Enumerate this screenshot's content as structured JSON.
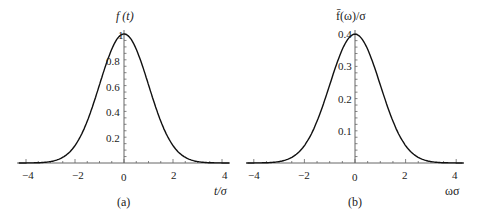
{
  "chart_data": [
    {
      "type": "line",
      "panel": "a",
      "caption": "(a)",
      "title": "",
      "xlabel": "t/σ",
      "ylabel": "f(t)",
      "xlim": [
        -4.2,
        4.2
      ],
      "ylim": [
        0,
        1.0
      ],
      "xticks": [
        -4,
        -2,
        0,
        2,
        4
      ],
      "xtick_labels": [
        "−4",
        "−2",
        "0",
        "2",
        "4"
      ],
      "yticks": [
        0.2,
        0.4,
        0.6,
        0.8,
        1
      ],
      "ytick_labels": [
        "0.2",
        "0.4",
        "0.6",
        "0.8",
        "1"
      ],
      "grid": false,
      "series": [
        {
          "name": "f(t)",
          "formula": "exp(-x^2/2)",
          "x": [
            -4,
            -3,
            -2.5,
            -2,
            -1.5,
            -1,
            -0.5,
            0,
            0.5,
            1,
            1.5,
            2,
            2.5,
            3,
            4
          ],
          "y": [
            0.0003,
            0.011,
            0.044,
            0.135,
            0.325,
            0.607,
            0.882,
            1.0,
            0.882,
            0.607,
            0.325,
            0.135,
            0.044,
            0.011,
            0.0003
          ]
        }
      ]
    },
    {
      "type": "line",
      "panel": "b",
      "caption": "(b)",
      "title": "",
      "xlabel": "ωσ",
      "ylabel": "f̄(ω)/σ",
      "xlim": [
        -4.2,
        4.2
      ],
      "ylim": [
        0,
        0.4
      ],
      "xticks": [
        -4,
        -2,
        0,
        2,
        4
      ],
      "xtick_labels": [
        "−4",
        "−2",
        "0",
        "2",
        "4"
      ],
      "yticks": [
        0.1,
        0.2,
        0.3,
        0.4
      ],
      "ytick_labels": [
        "0.1",
        "0.2",
        "0.3",
        "0.4"
      ],
      "grid": false,
      "series": [
        {
          "name": "f̄(ω)/σ",
          "formula": "exp(-x^2/2)/sqrt(2π)",
          "x": [
            -4,
            -3,
            -2.5,
            -2,
            -1.5,
            -1,
            -0.5,
            0,
            0.5,
            1,
            1.5,
            2,
            2.5,
            3,
            4
          ],
          "y": [
            0.0001,
            0.0044,
            0.0175,
            0.054,
            0.13,
            0.242,
            0.352,
            0.399,
            0.352,
            0.242,
            0.13,
            0.054,
            0.0175,
            0.0044,
            0.0001
          ]
        }
      ]
    }
  ],
  "panels": {
    "a": {
      "ylabel": "f (t)",
      "xlabel": "t/σ",
      "caption": "(a)",
      "xtick_labels": [
        "−4",
        "−2",
        "0",
        "2",
        "4"
      ],
      "ytick_labels": [
        "0.2",
        "0.4",
        "0.6",
        "0.8",
        "1"
      ]
    },
    "b": {
      "ylabel": "f̄(ω)/σ",
      "xlabel": "ωσ",
      "caption": "(b)",
      "xtick_labels": [
        "−4",
        "−2",
        "0",
        "2",
        "4"
      ],
      "ytick_labels": [
        "0.1",
        "0.2",
        "0.3",
        "0.4"
      ]
    },
    "colors": {
      "curve": "#111111",
      "axis": "#555555",
      "text": "#222222"
    }
  }
}
